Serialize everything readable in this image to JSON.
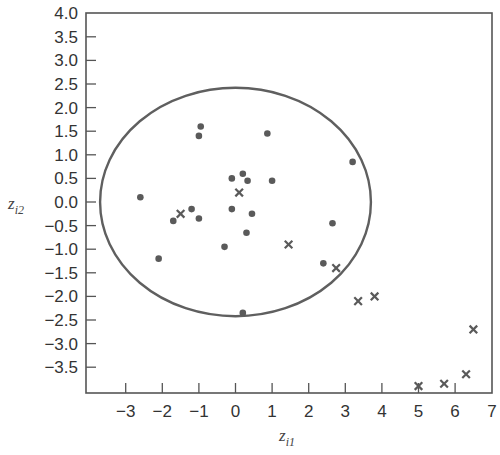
{
  "chart_data": {
    "type": "scatter",
    "title": "",
    "xlabel": "z_i1",
    "ylabel": "z_i2",
    "xlabel_main": "z",
    "xlabel_sub": "i1",
    "ylabel_main": "z",
    "ylabel_sub": "i2",
    "xlim": [
      -4.1,
      7.0
    ],
    "ylim": [
      -4.0,
      4.0
    ],
    "grid": false,
    "legend": "none",
    "x_ticks": [
      -3,
      -2,
      -1,
      0,
      1,
      2,
      3,
      4,
      5,
      6,
      7
    ],
    "x_tick_labels": [
      "−3",
      "−2",
      "−1",
      "0",
      "1",
      "2",
      "3",
      "4",
      "5",
      "6",
      "7"
    ],
    "y_ticks": [
      4.0,
      3.5,
      3.0,
      2.5,
      2.0,
      1.5,
      1.0,
      0.5,
      0.0,
      -0.5,
      -1.0,
      -1.5,
      -2.0,
      -2.5,
      -3.0,
      -3.5
    ],
    "y_tick_labels": [
      "4.0",
      "3.5",
      "3.0",
      "2.5",
      "2.0",
      "1.5",
      "1.0",
      "0.5",
      "0.0",
      "−0.5",
      "−1.0",
      "−1.5",
      "−2.0",
      "−2.5",
      "−3.0",
      "−3.5"
    ],
    "ellipse": {
      "cx": 0.0,
      "cy": 0.0,
      "rx": 3.7,
      "ry": 2.42
    },
    "series": [
      {
        "name": "dots",
        "marker": "circle",
        "points": [
          [
            -2.6,
            0.1
          ],
          [
            -1.0,
            1.4
          ],
          [
            -0.95,
            1.6
          ],
          [
            0.87,
            1.45
          ],
          [
            -0.1,
            0.5
          ],
          [
            0.2,
            0.6
          ],
          [
            0.33,
            0.45
          ],
          [
            1.0,
            0.45
          ],
          [
            3.2,
            0.85
          ],
          [
            -1.2,
            -0.15
          ],
          [
            -1.0,
            -0.35
          ],
          [
            -1.7,
            -0.4
          ],
          [
            -0.1,
            -0.15
          ],
          [
            0.45,
            -0.25
          ],
          [
            0.3,
            -0.65
          ],
          [
            -0.3,
            -0.95
          ],
          [
            -2.1,
            -1.2
          ],
          [
            2.65,
            -0.45
          ],
          [
            2.4,
            -1.3
          ],
          [
            0.2,
            -2.35
          ]
        ]
      },
      {
        "name": "crosses",
        "marker": "x",
        "points": [
          [
            0.1,
            0.2
          ],
          [
            -1.5,
            -0.25
          ],
          [
            1.45,
            -0.9
          ],
          [
            2.75,
            -1.4
          ],
          [
            3.35,
            -2.1
          ],
          [
            3.8,
            -2.0
          ],
          [
            6.5,
            -2.7
          ],
          [
            6.3,
            -3.65
          ],
          [
            5.7,
            -3.85
          ],
          [
            5.0,
            -3.9
          ]
        ]
      }
    ],
    "colors": {
      "axis": "#555555",
      "marker": "#5a5a5a",
      "ellipse": "#5f5f5f"
    }
  }
}
